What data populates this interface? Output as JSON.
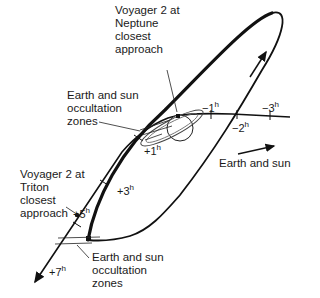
{
  "diagram": {
    "labels": {
      "neptune_closest": "Voyager 2 at\nNeptune\nclosest\napproach",
      "occultation_upper": "Earth and sun\noccultation\nzones",
      "triton_closest": "Voyager 2 at\nTriton\nclosest\napproach",
      "occultation_lower": "Earth and sun\noccultation\nzones",
      "earth_sun_direction": "Earth and sun"
    },
    "time_marks": [
      {
        "sign": "−",
        "value": "1",
        "unit": "h"
      },
      {
        "sign": "−",
        "value": "2",
        "unit": "h"
      },
      {
        "sign": "−",
        "value": "3",
        "unit": "h"
      },
      {
        "sign": "+",
        "value": "1",
        "unit": "h"
      },
      {
        "sign": "+",
        "value": "3",
        "unit": "h"
      },
      {
        "sign": "+",
        "value": "5",
        "unit": "h"
      },
      {
        "sign": "+",
        "value": "7",
        "unit": "h"
      }
    ],
    "colors": {
      "line": "#111111",
      "ring": "#555555",
      "background": "#ffffff"
    }
  }
}
